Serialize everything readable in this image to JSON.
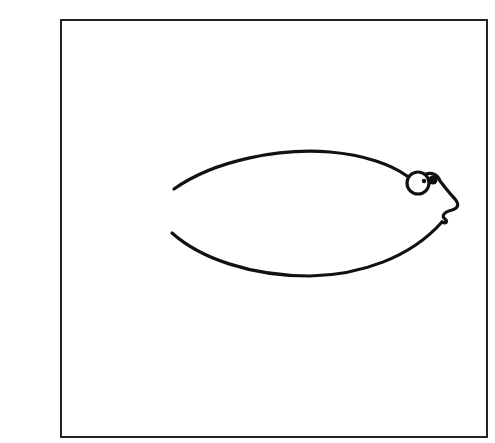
{
  "figure": {
    "title": "",
    "colors": {
      "stroke": "#111111",
      "frame": "#222222",
      "background": "#ffffff"
    },
    "parts": [
      {
        "name": "body-upper-curve",
        "type": "curve"
      },
      {
        "name": "body-lower-curve",
        "type": "curve"
      },
      {
        "name": "eye",
        "type": "circle-with-pupil"
      },
      {
        "name": "mouth",
        "type": "zigzag"
      }
    ]
  }
}
